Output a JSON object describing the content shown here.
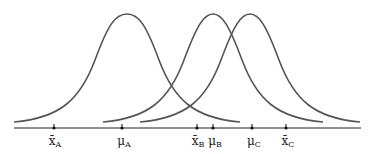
{
  "diagram": {
    "type": "three overlapping normal distributions on a number line",
    "curves": [
      {
        "name": "A",
        "center_label": "μA"
      },
      {
        "name": "B",
        "center_label": "μB"
      },
      {
        "name": "C",
        "center_label": "μC"
      }
    ],
    "ticks": [
      {
        "id": "xbar-a",
        "symbol": "x̄",
        "sub": "A",
        "x": 54
      },
      {
        "id": "mu-a",
        "symbol": "μ",
        "sub": "A",
        "x": 122
      },
      {
        "id": "xbar-b",
        "symbol": "x̄",
        "sub": "B",
        "x": 197
      },
      {
        "id": "mu-b",
        "symbol": "μ",
        "sub": "B",
        "x": 213
      },
      {
        "id": "mu-c",
        "symbol": "μ",
        "sub": "C",
        "x": 252
      },
      {
        "id": "xbar-c",
        "symbol": "x̄",
        "sub": "C",
        "x": 286
      }
    ],
    "colors": {
      "curve": "#555555",
      "axis": "#222222"
    }
  }
}
